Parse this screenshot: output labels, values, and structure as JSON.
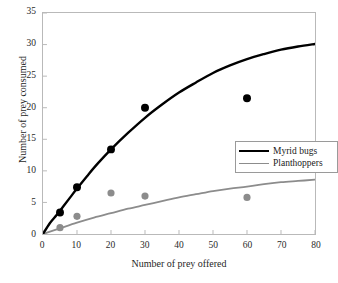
{
  "chart_data": {
    "type": "scatter",
    "title": "",
    "xlabel": "Number of prey offered",
    "ylabel": "Number of prey consumed",
    "xlim": [
      0,
      80
    ],
    "ylim": [
      0,
      35
    ],
    "xticks": [
      0,
      10,
      20,
      30,
      40,
      50,
      60,
      70,
      80
    ],
    "yticks": [
      0,
      5,
      10,
      15,
      20,
      25,
      30,
      35
    ],
    "xtick_labels": [
      "0",
      "10",
      "20",
      "30",
      "40",
      "50",
      "60",
      "70",
      "80"
    ],
    "ytick_labels": [
      "0",
      "5",
      "10",
      "15",
      "20",
      "25",
      "30",
      "35"
    ],
    "grid": false,
    "legend_position": "center-right",
    "series": [
      {
        "name": "Myrid bugs",
        "color": "#000000",
        "marker": "filled-circle",
        "points": [
          {
            "x": 5,
            "y": 3.4
          },
          {
            "x": 10,
            "y": 7.4
          },
          {
            "x": 20,
            "y": 13.4
          },
          {
            "x": 30,
            "y": 20.0
          },
          {
            "x": 60,
            "y": 21.5
          }
        ],
        "fit_curve": [
          {
            "x": 0,
            "y": 0.0
          },
          {
            "x": 2,
            "y": 1.7
          },
          {
            "x": 4,
            "y": 3.0
          },
          {
            "x": 6,
            "y": 4.4
          },
          {
            "x": 8,
            "y": 5.8
          },
          {
            "x": 10,
            "y": 7.2
          },
          {
            "x": 13,
            "y": 9.2
          },
          {
            "x": 16,
            "y": 11.1
          },
          {
            "x": 20,
            "y": 13.4
          },
          {
            "x": 25,
            "y": 16.0
          },
          {
            "x": 30,
            "y": 18.4
          },
          {
            "x": 35,
            "y": 20.5
          },
          {
            "x": 40,
            "y": 22.4
          },
          {
            "x": 45,
            "y": 24.0
          },
          {
            "x": 50,
            "y": 25.5
          },
          {
            "x": 55,
            "y": 26.7
          },
          {
            "x": 60,
            "y": 27.7
          },
          {
            "x": 65,
            "y": 28.5
          },
          {
            "x": 70,
            "y": 29.2
          },
          {
            "x": 75,
            "y": 29.7
          },
          {
            "x": 80,
            "y": 30.1
          }
        ]
      },
      {
        "name": "Planthoppers",
        "color": "#8c8c8c",
        "marker": "filled-circle",
        "points": [
          {
            "x": 5,
            "y": 1.0
          },
          {
            "x": 10,
            "y": 2.8
          },
          {
            "x": 20,
            "y": 6.5
          },
          {
            "x": 30,
            "y": 6.0
          },
          {
            "x": 60,
            "y": 5.8
          }
        ],
        "fit_curve": [
          {
            "x": 0,
            "y": 0.0
          },
          {
            "x": 5,
            "y": 0.9
          },
          {
            "x": 10,
            "y": 1.8
          },
          {
            "x": 15,
            "y": 2.6
          },
          {
            "x": 20,
            "y": 3.3
          },
          {
            "x": 25,
            "y": 4.0
          },
          {
            "x": 30,
            "y": 4.6
          },
          {
            "x": 35,
            "y": 5.2
          },
          {
            "x": 40,
            "y": 5.8
          },
          {
            "x": 45,
            "y": 6.3
          },
          {
            "x": 50,
            "y": 6.8
          },
          {
            "x": 55,
            "y": 7.2
          },
          {
            "x": 60,
            "y": 7.5
          },
          {
            "x": 65,
            "y": 7.9
          },
          {
            "x": 70,
            "y": 8.2
          },
          {
            "x": 75,
            "y": 8.4
          },
          {
            "x": 80,
            "y": 8.6
          }
        ]
      }
    ]
  },
  "legend": {
    "entries": [
      {
        "label": "Myrid bugs"
      },
      {
        "label": "Planthoppers"
      }
    ]
  },
  "axes": {
    "xlabel": "Number of prey offered",
    "ylabel": "Number of prey consumed"
  },
  "colors": {
    "myrid": "#000000",
    "planthopper": "#8c8c8c",
    "axis": "#b9b9b9",
    "background": "#ffffff"
  }
}
